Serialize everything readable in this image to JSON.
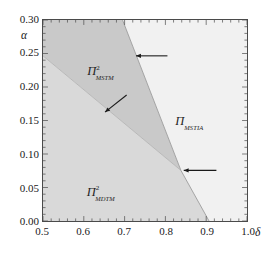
{
  "figure": {
    "kind": "phase-diagram",
    "background": "#ffffff"
  },
  "axes": {
    "x": {
      "name": "δ",
      "min": 0.5,
      "max": 1.0,
      "ticks": [
        "0.5",
        "0.6",
        "0.7",
        "0.8",
        "0.9",
        "1.0"
      ],
      "tick_values": [
        0.5,
        0.6,
        0.7,
        0.8,
        0.9,
        1.0
      ],
      "minor_per_major": 5
    },
    "y": {
      "name": "α",
      "min": 0.0,
      "max": 0.3,
      "ticks": [
        "0.00",
        "0.05",
        "0.10",
        "0.15",
        "0.20",
        "0.25",
        "0.30"
      ],
      "tick_values": [
        0.0,
        0.05,
        0.1,
        0.15,
        0.2,
        0.25,
        0.3
      ],
      "minor_per_major": 5
    },
    "frame_color": "#4a4a4a"
  },
  "chart_data": {
    "type": "area",
    "title": "",
    "xlabel": "δ",
    "ylabel": "α",
    "xlim": [
      0.5,
      1.0
    ],
    "ylim": [
      0.0,
      0.3
    ],
    "grid": false,
    "legend": "none",
    "regions": [
      {
        "id": "mstm",
        "label_pi": "Π",
        "label_sup": "2",
        "label_sub": "MSTM",
        "color": "#c9c9c9",
        "label_xy": [
          0.645,
          0.225
        ],
        "polygon": [
          [
            0.5,
            0.3
          ],
          [
            0.695,
            0.3
          ],
          [
            0.838,
            0.0755
          ],
          [
            0.5,
            0.2465
          ]
        ]
      },
      {
        "id": "mdtm",
        "label_pi": "Π",
        "label_sup": "2",
        "label_sub": "MDTM",
        "color": "#d9d9d9",
        "label_xy": [
          0.645,
          0.047
        ],
        "polygon": [
          [
            0.5,
            0.2465
          ],
          [
            0.838,
            0.0755
          ],
          [
            0.907,
            0.0
          ],
          [
            0.5,
            0.0
          ]
        ]
      },
      {
        "id": "mstia",
        "label_pi": "Π",
        "label_sup": "",
        "label_sub": "MSTIA",
        "color": "#f1f1f1",
        "label_xy": [
          0.855,
          0.152
        ],
        "polygon": [
          [
            0.695,
            0.3
          ],
          [
            1.0,
            0.3
          ],
          [
            1.0,
            0.0
          ],
          [
            0.907,
            0.0
          ],
          [
            0.838,
            0.0755
          ]
        ]
      }
    ],
    "boundaries": [
      {
        "id": "mstm-mstia-upper",
        "from": [
          0.695,
          0.3
        ],
        "to": [
          0.838,
          0.0755
        ],
        "color": "#9a9a9a"
      },
      {
        "id": "mdtm-mstia-lower",
        "from": [
          0.838,
          0.0755
        ],
        "to": [
          0.907,
          0.0
        ],
        "color": "#9a9a9a"
      },
      {
        "id": "mstm-mdtm-inner",
        "from": [
          0.5,
          0.2465
        ],
        "to": [
          0.838,
          0.0755
        ],
        "color": "#b4b4b4"
      }
    ],
    "annotations": [
      {
        "id": "arrow-upper",
        "kind": "arrow",
        "points_to": [
          0.728,
          0.2465
        ],
        "tail": [
          0.805,
          0.2465
        ],
        "direction": "left",
        "color": "#1a1a1a"
      },
      {
        "id": "arrow-inner",
        "kind": "arrow",
        "points_to": [
          0.652,
          0.1625
        ],
        "tail": [
          0.705,
          0.188
        ],
        "direction": "down-left",
        "color": "#1a1a1a"
      },
      {
        "id": "arrow-lower",
        "kind": "arrow",
        "points_to": [
          0.845,
          0.0755
        ],
        "tail": [
          0.925,
          0.0755
        ],
        "direction": "left",
        "color": "#1a1a1a"
      }
    ]
  }
}
